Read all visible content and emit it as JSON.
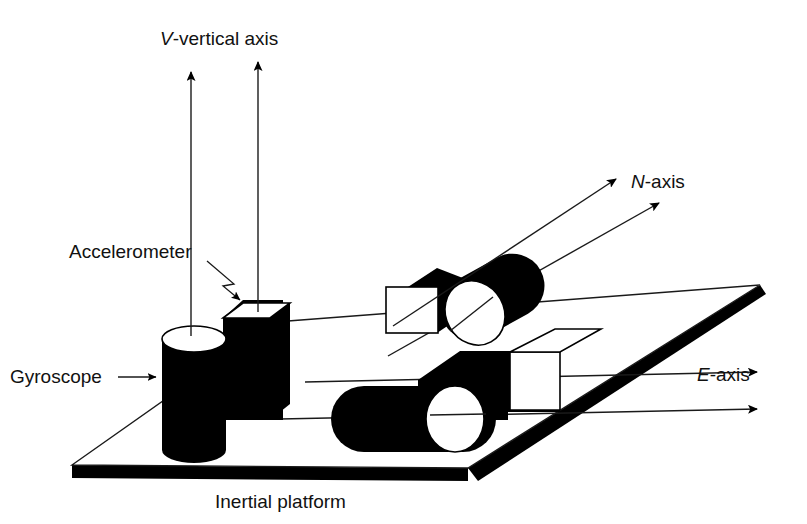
{
  "figure": {
    "background_color": "#ffffff",
    "ink_color": "#000000"
  },
  "labels": {
    "vertical_axis": {
      "italic_prefix": "V",
      "rest": "-vertical axis",
      "full": "V-vertical axis",
      "x": 160,
      "y": 45
    },
    "north_axis": {
      "italic_prefix": "N",
      "rest": "-axis",
      "full": "N-axis",
      "x": 631,
      "y": 188
    },
    "east_axis": {
      "italic_prefix": "E",
      "rest": "-axis",
      "full": "E-axis",
      "x": 697,
      "y": 381
    },
    "accelerometer": {
      "full": "Accelerometer",
      "x": 69,
      "y": 258
    },
    "gyroscope": {
      "full": "Gyroscope",
      "x": 10,
      "y": 383
    },
    "inertial_platform": {
      "full": "Inertial platform",
      "x": 215,
      "y": 508
    }
  },
  "axes": [
    {
      "name": "vertical-axis-arrow-left",
      "x1": 191,
      "y1": 310,
      "x2": 191,
      "y2": 68
    },
    {
      "name": "vertical-axis-arrow-right",
      "x1": 258,
      "y1": 312,
      "x2": 258,
      "y2": 58
    },
    {
      "name": "north-axis-arrow-upper",
      "x1": 393,
      "y1": 326,
      "x2": 620,
      "y2": 176
    },
    {
      "name": "north-axis-arrow-lower",
      "x1": 388,
      "y1": 356,
      "x2": 664,
      "y2": 200
    },
    {
      "name": "east-axis-arrow-upper",
      "x1": 305,
      "y1": 382,
      "x2": 762,
      "y2": 372
    },
    {
      "name": "east-axis-arrow-lower",
      "x1": 280,
      "y1": 419,
      "x2": 762,
      "y2": 409
    }
  ],
  "components": {
    "platform": {
      "name": "inertial-platform",
      "corners": "72,465 275,322 760,285 468,468"
    },
    "gyroscope_vertical": {
      "name": "gyroscope-vertical-cylinder",
      "orientation": "vertical",
      "top_face": "ellipse-white"
    },
    "accelerometer_vertical": {
      "name": "accelerometer-vertical-cube",
      "shape": "cube",
      "top_face": "white"
    },
    "gyroscope_north": {
      "name": "gyroscope-north-cylinder",
      "orientation": "diagonal",
      "end_face": "ellipse-white"
    },
    "accelerometer_north": {
      "name": "accelerometer-north-cube",
      "shape": "cube",
      "front_face": "white"
    },
    "gyroscope_east": {
      "name": "gyroscope-east-cylinder",
      "orientation": "horizontal",
      "end_face": "ellipse-white"
    },
    "accelerometer_east": {
      "name": "accelerometer-east-cube",
      "shape": "cube",
      "front_face": "white"
    }
  },
  "leaders": {
    "accelerometer_pointer": {
      "name": "accelerometer-leader-arrow",
      "path": "M 210,262 L 233,283 L 224,285 L 243,303"
    },
    "gyroscope_pointer": {
      "name": "gyroscope-leader-arrow",
      "x1": 118,
      "y1": 377,
      "x2": 160,
      "y2": 377
    }
  }
}
